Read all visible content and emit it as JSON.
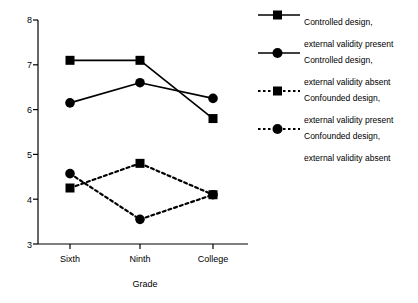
{
  "chart_data": {
    "type": "line",
    "title": "",
    "xlabel": "Grade",
    "ylabel": "",
    "categories": [
      "Sixth",
      "Ninth",
      "College"
    ],
    "ylim": [
      3,
      8
    ],
    "yticks": [
      3,
      4,
      5,
      6,
      7,
      8
    ],
    "ytick_labels": [
      "3",
      "4",
      "5",
      "6",
      "7",
      "8"
    ],
    "grid": false,
    "legend_position": "right",
    "series": [
      {
        "name": "Controlled design, external validity present",
        "label_line1": "Controlled design,",
        "label_line2": "external validity present",
        "values": [
          7.1,
          7.1,
          5.8
        ],
        "marker": "square",
        "linestyle": "solid",
        "color": "#000000"
      },
      {
        "name": "Controlled design, external validity absent",
        "label_line1": "Controlled design,",
        "label_line2": "external validity absent",
        "values": [
          6.15,
          6.6,
          6.25
        ],
        "marker": "circle",
        "linestyle": "solid",
        "color": "#000000"
      },
      {
        "name": "Confounded design, external validity present",
        "label_line1": "Confounded design,",
        "label_line2": "external validity present",
        "values": [
          4.25,
          4.8,
          4.1
        ],
        "marker": "square",
        "linestyle": "dotted",
        "color": "#000000"
      },
      {
        "name": "Confounded design, external validity absent",
        "label_line1": "Confounded design,",
        "label_line2": "external validity absent",
        "values": [
          4.57,
          3.55,
          4.1
        ],
        "marker": "circle",
        "linestyle": "dotted",
        "color": "#000000"
      }
    ]
  },
  "axes": {
    "y_tick_labels": [
      "8",
      "7",
      "6",
      "5",
      "4",
      "3"
    ],
    "x_tick_labels": [
      "Sixth",
      "Ninth",
      "College"
    ],
    "x_title": "Grade"
  },
  "legend": {
    "entries": [
      {
        "line1": "Controlled design,",
        "line2": "external validity present"
      },
      {
        "line1": "Controlled design,",
        "line2": "external validity absent"
      },
      {
        "line1": "Confounded design,",
        "line2": "external validity present"
      },
      {
        "line1": "Confounded design,",
        "line2": "external validity absent"
      }
    ]
  }
}
